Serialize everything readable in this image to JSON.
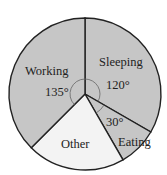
{
  "chart_data": {
    "type": "pie",
    "title": "",
    "start": "top, clockwise",
    "slices": [
      {
        "label": "Sleeping",
        "angle": 120,
        "angle_label": "120°",
        "color": "#c6c6c6"
      },
      {
        "label": "Eating",
        "angle": 30,
        "angle_label": "30°",
        "color": "#c6c6c6"
      },
      {
        "label": "Other",
        "angle": 75,
        "angle_label": "",
        "color": "#f3f3f3"
      },
      {
        "label": "Working",
        "angle": 135,
        "angle_label": "135°",
        "color": "#c6c6c6"
      }
    ],
    "categories": [
      "Sleeping",
      "Eating",
      "Other",
      "Working"
    ],
    "values": [
      120,
      30,
      75,
      135
    ],
    "units": "degrees"
  },
  "labels": {
    "sleeping": "Sleeping",
    "sleeping_angle": "120°",
    "eating": "Eating",
    "eating_angle": "30°",
    "other": "Other",
    "working": "Working",
    "working_angle": "135°"
  }
}
